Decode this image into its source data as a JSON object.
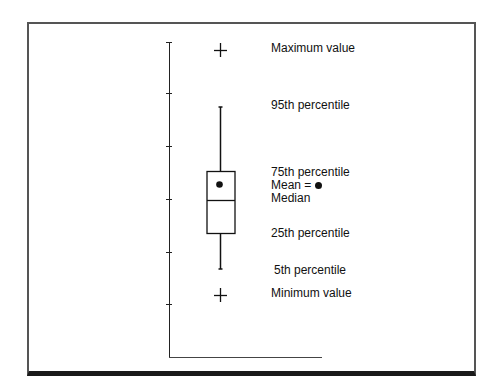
{
  "diagram": {
    "type": "box-plot-legend",
    "labels": {
      "maximum": "Maximum value",
      "p95": "95th percentile",
      "p75": "75th percentile",
      "mean": "Mean =",
      "median": "Median",
      "p25": "25th percentile",
      "p5": "5th percentile",
      "minimum": "Minimum value"
    },
    "markers": {
      "maximum": "plus-sign",
      "minimum": "plus-sign",
      "mean": "filled-circle"
    },
    "y_axis_ticks": 6,
    "colors": {
      "line": "#111111",
      "frame": "#555555",
      "frame_bottom": "#1a1a1a",
      "background": "#ffffff"
    }
  }
}
